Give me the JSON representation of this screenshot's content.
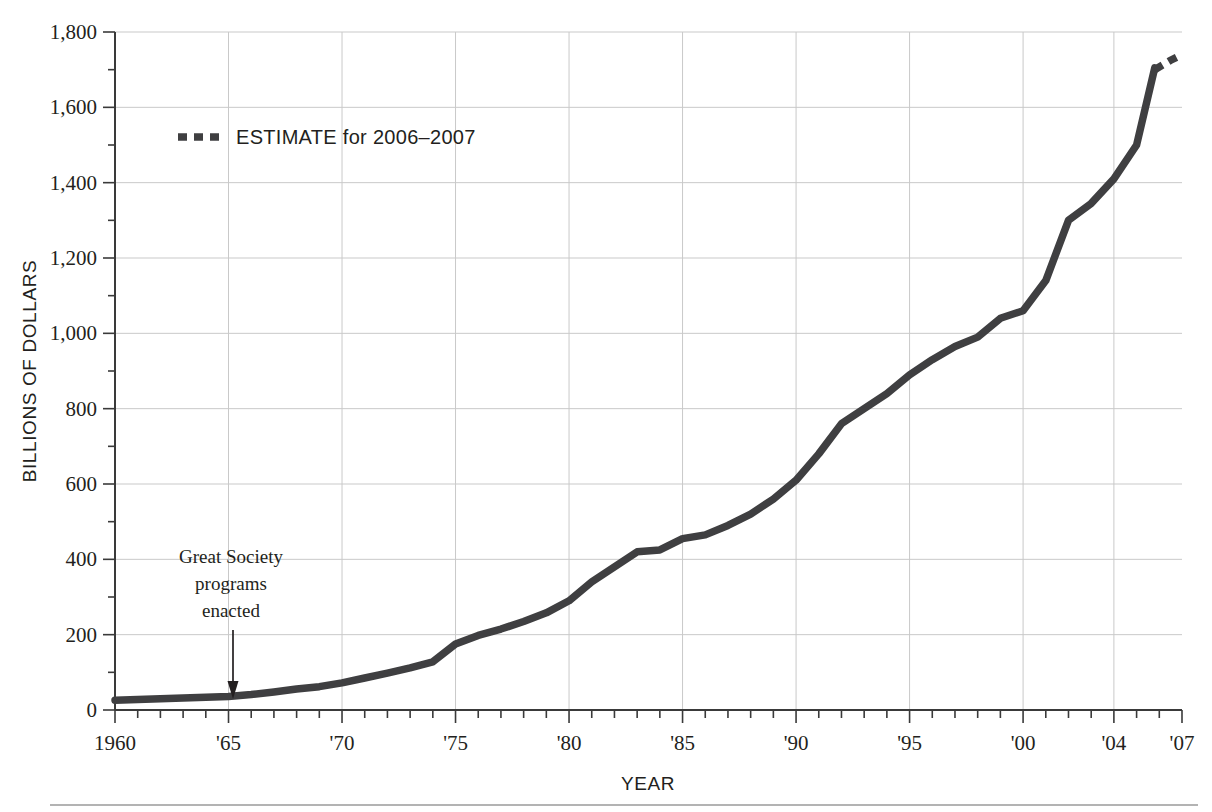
{
  "chart_data": {
    "type": "line",
    "title": "",
    "xlabel": "YEAR",
    "ylabel": "BILLIONS OF DOLLARS",
    "xlim": [
      1960,
      2007
    ],
    "ylim": [
      0,
      1800
    ],
    "grid": true,
    "y_ticks": [
      0,
      200,
      400,
      600,
      800,
      1000,
      1200,
      1400,
      1600,
      1800
    ],
    "y_tick_labels": [
      "0",
      "200",
      "400",
      "600",
      "800",
      "1,000",
      "1,200",
      "1,400",
      "1,600",
      "1,800"
    ],
    "y_minor_tick_step": 100,
    "x_ticks": [
      1960,
      1965,
      1970,
      1975,
      1980,
      1985,
      1990,
      1995,
      2000,
      2004,
      2007
    ],
    "x_tick_labels": [
      "1960",
      "'65",
      "'70",
      "'75",
      "'80",
      "'85",
      "'90",
      "'95",
      "'00",
      "'04",
      "'07"
    ],
    "x_minor_tick_step": 1,
    "legend_position": "upper-left-inside",
    "line_color": "#3f3f41",
    "grid_color": "#c9c9c9",
    "series": [
      {
        "name": "Actual",
        "style": "solid",
        "x": [
          1960,
          1961,
          1962,
          1963,
          1964,
          1965,
          1966,
          1967,
          1968,
          1969,
          1970,
          1971,
          1972,
          1973,
          1974,
          1975,
          1976,
          1977,
          1978,
          1979,
          1980,
          1981,
          1982,
          1983,
          1984,
          1985,
          1986,
          1987,
          1988,
          1989,
          1990,
          1991,
          1992,
          1993,
          1994,
          1995,
          1996,
          1997,
          1998,
          1999,
          2000,
          2001,
          2002,
          2003,
          2004,
          2005
        ],
        "values": [
          26,
          28,
          30,
          32,
          34,
          36,
          41,
          48,
          56,
          62,
          72,
          85,
          98,
          112,
          128,
          175,
          198,
          215,
          235,
          258,
          290,
          340,
          380,
          420,
          425,
          455,
          465,
          490,
          520,
          560,
          610,
          680,
          760,
          800,
          840,
          890,
          930,
          965,
          990,
          1040,
          1060,
          1140,
          1300,
          1345,
          1410,
          1500
        ],
        "last_solid_point": 1705
      },
      {
        "name": "ESTIMATE for 2006–2007",
        "style": "dotted",
        "x": [
          2005.8,
          2006.5,
          2007
        ],
        "values": [
          1700,
          1725,
          1740
        ]
      }
    ],
    "annotations": [
      {
        "name": "great-society",
        "lines": [
          "Great Society",
          "programs",
          "enacted"
        ],
        "x": 1965,
        "y_text": 420,
        "y_target": 40,
        "arrow": "down"
      }
    ],
    "legend": [
      {
        "label": "ESTIMATE for 2006–2007",
        "marker": "dotted-line",
        "color": "#3f3f41"
      }
    ]
  }
}
